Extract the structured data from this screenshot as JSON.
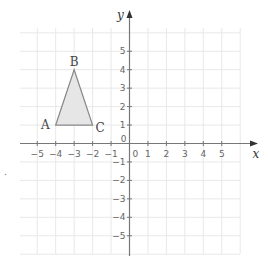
{
  "diagram": {
    "type": "coordinate-plane",
    "axes": {
      "x_label": "x",
      "y_label": "y",
      "x_ticks": [
        "-5",
        "-4",
        "-3",
        "-2",
        "-1",
        "0",
        "1",
        "2",
        "3",
        "4",
        "5"
      ],
      "y_ticks": [
        "5",
        "4",
        "3",
        "2",
        "1",
        "0",
        "-1",
        "-2",
        "-3",
        "-4",
        "-5"
      ],
      "range": [
        -6,
        6
      ]
    },
    "triangle": {
      "fill": "#e6e6e6",
      "stroke": "#888888",
      "vertices": [
        {
          "label": "A",
          "x": -4,
          "y": 1
        },
        {
          "label": "B",
          "x": -3,
          "y": 4
        },
        {
          "label": "C",
          "x": -2,
          "y": 1
        }
      ]
    },
    "colors": {
      "grid": "#e8e8e8",
      "axis": "#777777"
    },
    "stray_mark": "."
  }
}
